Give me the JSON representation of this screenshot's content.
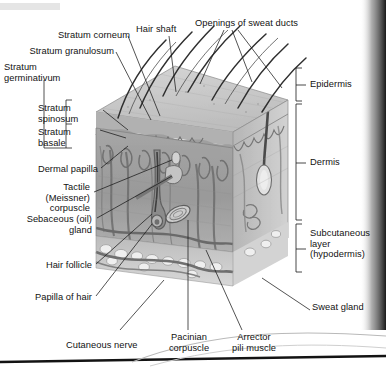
{
  "figure": {
    "type": "anatomical-diagram",
    "palette": {
      "ink": "#121212",
      "leader_line": "#1a1a1a",
      "epidermis_surface": "#c9c9c9",
      "epidermis_band": "#b4b4b4",
      "dermis_face": "#9b9b9b",
      "dermis_side": "#ababab",
      "hypodermis": "#cdcdcd",
      "vessel": "#6e6e6e",
      "hair": "#3a3a3a",
      "page_edge": "#111111",
      "scan_shadow": "#1b1b1b"
    }
  },
  "labels": {
    "stratum_corneum": "Stratum corneum",
    "hair_shaft": "Hair shaft",
    "sweat_duct_openings": "Openings of sweat ducts",
    "stratum_granulosum": "Stratum granulosum",
    "stratum_germinativum": "Stratum\ngerminativum",
    "stratum_spinosum": "Stratum\nspinosum",
    "stratum_basale": "Stratum\nbasale",
    "dermal_papilla": "Dermal papilla",
    "tactile_corpuscle": "Tactile\n(Meissner)\ncorpuscle",
    "sebaceous_gland": "Sebaceous (oil)\ngland",
    "hair_follicle": "Hair follicle",
    "papilla_of_hair": "Papilla of hair",
    "cutaneous_nerve": "Cutaneous nerve",
    "pacinian_corpuscle": "Pacinian\ncorpuscle",
    "arrector_pili": "Arrector\npili muscle",
    "epidermis": "Epidermis",
    "dermis": "Dermis",
    "subcutaneous_layer": "Subcutaneous\nlayer\n(hypodermis)",
    "sweat_gland": "Sweat gland"
  },
  "layer_brackets": [
    {
      "name": "Epidermis",
      "span_top": 68,
      "span_bottom": 101
    },
    {
      "name": "Dermis",
      "span_top": 101,
      "span_bottom": 223
    },
    {
      "name": "Subcutaneous layer (hypodermis)",
      "span_top": 223,
      "span_bottom": 272
    }
  ],
  "structures": [
    "hair shafts",
    "sweat duct openings",
    "dermal papillae",
    "sebaceous gland",
    "hair follicle",
    "papilla of hair",
    "arrector pili muscle",
    "Pacinian corpuscle",
    "Meissner corpuscle",
    "sweat gland",
    "cutaneous nerve",
    "blood vessels",
    "adipose tissue"
  ]
}
